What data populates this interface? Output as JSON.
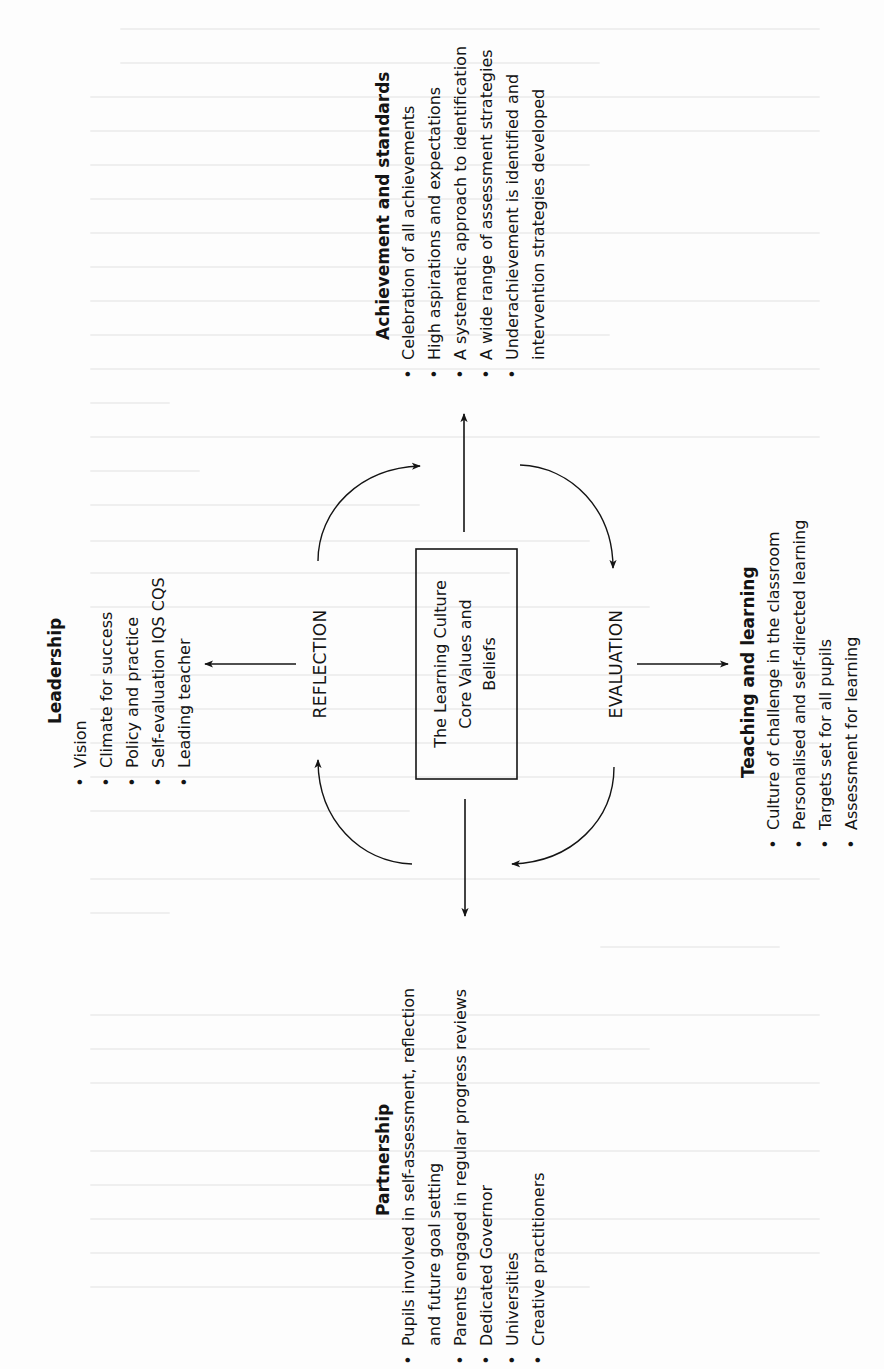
{
  "diagram": {
    "orientation": "rotated-90-ccw",
    "center": {
      "lines": [
        "The Learning Culture",
        "Core Values and",
        "Beliefs"
      ]
    },
    "cycle_labels": {
      "left": "REFLECTION",
      "right": "EVALUATION"
    },
    "sections": {
      "achievement": {
        "heading": "Achievement and standards",
        "items": [
          "Celebration of all achievements",
          "High aspirations and expectations",
          "A systematic approach to identification",
          "A wide range of assessment strategies",
          "Underachievement is identified and",
          "intervention strategies developed"
        ],
        "bullet": "•"
      },
      "leadership": {
        "heading": "Leadership",
        "items": [
          "Vision",
          "Climate for success",
          "Policy and practice",
          "Self-evaluation IQS CQS",
          "Leading teacher"
        ],
        "bullet": "•"
      },
      "teaching": {
        "heading": "Teaching and learning",
        "items": [
          "Culture of challenge in the classroom",
          "Personalised and self-directed learning",
          "Targets set for all pupils",
          "Assessment for learning"
        ],
        "bullet": "•"
      },
      "partnership": {
        "heading": "Partnership",
        "items": [
          "Pupils involved in self-assessment, reflection",
          "and future goal setting",
          "Parents engaged in regular progress reviews",
          "Dedicated Governor",
          "Universities",
          "Creative practitioners"
        ],
        "bullet": "•"
      }
    },
    "colors": {
      "ink": "#141414",
      "paper": "#fdfdfd"
    }
  }
}
